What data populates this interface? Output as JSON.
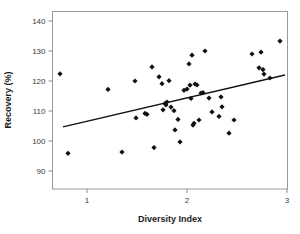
{
  "chart_data": {
    "type": "scatter",
    "title": "",
    "xlabel": "Diversity Index",
    "ylabel": "Recovery (%)",
    "xlim": [
      0.65,
      3.02
    ],
    "ylim": [
      84.5,
      146.0
    ],
    "xticks": [
      1,
      2,
      3
    ],
    "xtick_labels": [
      "1",
      "2",
      "3"
    ],
    "yticks": [
      90,
      100,
      110,
      120,
      130,
      140
    ],
    "ytick_labels": [
      "90",
      "100",
      "110",
      "120",
      "130",
      "140"
    ],
    "grid": false,
    "legend": false,
    "marker": "diamond",
    "marker_color": "#111111",
    "frame_color": "#9a9a9a",
    "points": [
      [
        0.73,
        122.4
      ],
      [
        0.81,
        95.9
      ],
      [
        1.21,
        117.2
      ],
      [
        1.35,
        96.3
      ],
      [
        1.48,
        120.0
      ],
      [
        1.49,
        107.7
      ],
      [
        1.58,
        109.2
      ],
      [
        1.6,
        108.9
      ],
      [
        1.65,
        124.7
      ],
      [
        1.67,
        97.8
      ],
      [
        1.72,
        121.4
      ],
      [
        1.75,
        119.1
      ],
      [
        1.76,
        110.4
      ],
      [
        1.78,
        112.5
      ],
      [
        1.79,
        112.0
      ],
      [
        1.8,
        113.0
      ],
      [
        1.82,
        120.1
      ],
      [
        1.84,
        111.3
      ],
      [
        1.87,
        110.1
      ],
      [
        1.88,
        103.7
      ],
      [
        1.91,
        107.2
      ],
      [
        1.93,
        99.7
      ],
      [
        1.97,
        116.9
      ],
      [
        2.0,
        117.3
      ],
      [
        2.02,
        125.7
      ],
      [
        2.03,
        118.6
      ],
      [
        2.04,
        114.2
      ],
      [
        2.05,
        128.6
      ],
      [
        2.06,
        105.3
      ],
      [
        2.07,
        105.9
      ],
      [
        2.08,
        119.0
      ],
      [
        2.1,
        118.7
      ],
      [
        2.12,
        107.0
      ],
      [
        2.14,
        116.0
      ],
      [
        2.16,
        116.1
      ],
      [
        2.18,
        130.0
      ],
      [
        2.22,
        114.3
      ],
      [
        2.25,
        109.7
      ],
      [
        2.32,
        108.2
      ],
      [
        2.34,
        114.7
      ],
      [
        2.35,
        111.4
      ],
      [
        2.42,
        102.6
      ],
      [
        2.47,
        107.0
      ],
      [
        2.65,
        129.0
      ],
      [
        2.72,
        124.4
      ],
      [
        2.74,
        129.6
      ],
      [
        2.76,
        123.8
      ],
      [
        2.77,
        122.3
      ],
      [
        2.83,
        121.0
      ],
      [
        2.93,
        133.3
      ]
    ],
    "trend_line": {
      "x_start": 0.76,
      "y_start": 104.7,
      "x_end": 2.98,
      "y_end": 122.0
    }
  }
}
